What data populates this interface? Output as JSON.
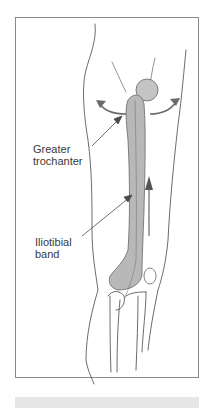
{
  "figure": {
    "labels": {
      "greater_trochanter": [
        "Greater",
        "trochanter"
      ],
      "iliotibial_band": [
        "Iliotibial",
        "band"
      ]
    },
    "colors": {
      "frame": "#8a8a8a",
      "outline": "#5a5a5a",
      "band_fill": "#b8b8b8",
      "arrow": "#6a6a6a",
      "bottom_bar": "#e6e6e6"
    },
    "icons": {
      "rotation_arrows": "curved-arrows-icon",
      "direction_arrow": "up-arrow-icon"
    }
  }
}
